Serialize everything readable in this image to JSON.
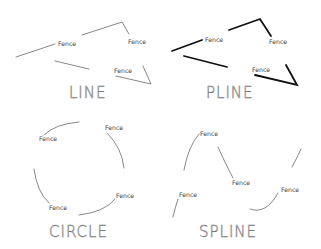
{
  "panels": [
    {
      "id": "line",
      "title": "LINE",
      "style": "thin",
      "labels": [
        "Fence",
        "Fence",
        "Fence"
      ]
    },
    {
      "id": "pline",
      "title": "PLINE",
      "style": "thick",
      "labels": [
        "Fence",
        "Fence",
        "Fence"
      ]
    },
    {
      "id": "circle",
      "title": "CIRCLE",
      "style": "thin",
      "labels": [
        "Fence",
        "Fence",
        "Fence",
        "Fence"
      ]
    },
    {
      "id": "spline",
      "title": "SPLINE",
      "style": "thin",
      "labels": [
        "Fence",
        "Fence",
        "Fence",
        "Fence"
      ]
    }
  ],
  "colors": {
    "thin_line": "#555555",
    "thick_line": "#111111",
    "text": "#444444",
    "title": "#777777",
    "background": "#ffffff"
  }
}
